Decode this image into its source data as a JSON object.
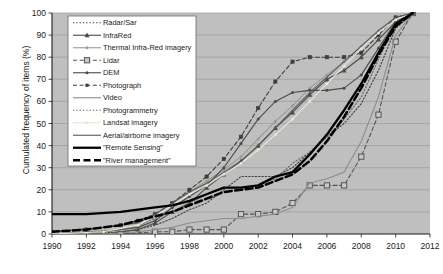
{
  "chart_data": {
    "type": "line",
    "title": "",
    "xlabel": "",
    "ylabel": "Cumulated frequency of items (%)",
    "xlim": [
      1990,
      2012
    ],
    "ylim": [
      0,
      100
    ],
    "xticks": [
      1990,
      1992,
      1994,
      1996,
      1998,
      2000,
      2002,
      2004,
      2006,
      2008,
      2010,
      2012
    ],
    "yticks": [
      0,
      10,
      20,
      30,
      40,
      50,
      60,
      70,
      80,
      90,
      100
    ],
    "grid": "horizontal",
    "legend_position": "upper-left-inside",
    "plot_background": "#bfbfbf",
    "series": [
      {
        "name": "Radar/Sar",
        "color": "#3a3a3a",
        "style": "dotted",
        "marker": "none",
        "x": [
          1990,
          1992,
          1994,
          1995,
          1996,
          1997,
          1998,
          1999,
          2000,
          2001,
          2002,
          2003,
          2004,
          2005,
          2006,
          2007,
          2008,
          2009,
          2010,
          2011
        ],
        "values": [
          0,
          0,
          1,
          2,
          4,
          7,
          11,
          14,
          20,
          26,
          26,
          26,
          30,
          37,
          44,
          50,
          59,
          74,
          93,
          100
        ]
      },
      {
        "name": "InfraRed",
        "color": "#4a4a4a",
        "style": "solid",
        "marker": "triangle",
        "x": [
          1990,
          1993,
          1995,
          1996,
          1997,
          1998,
          1999,
          2000,
          2001,
          2002,
          2003,
          2004,
          2005,
          2006,
          2007,
          2008,
          2009,
          2010,
          2011
        ],
        "values": [
          0,
          0,
          2,
          5,
          10,
          14,
          21,
          27,
          33,
          40,
          48,
          55,
          63,
          70,
          74,
          80,
          88,
          96,
          100
        ]
      },
      {
        "name": "Thermal Infra-Red imagery",
        "color": "#9a9a9a",
        "style": "solid",
        "marker": "dot",
        "x": [
          1990,
          1993,
          1995,
          1996,
          1997,
          1998,
          1999,
          2000,
          2001,
          2002,
          2003,
          2004,
          2005,
          2006,
          2007,
          2008,
          2009,
          2010,
          2011
        ],
        "values": [
          0,
          1,
          3,
          8,
          14,
          19,
          24,
          29,
          35,
          43,
          51,
          58,
          66,
          72,
          78,
          85,
          92,
          98,
          100
        ]
      },
      {
        "name": "Lidar",
        "color": "#555555",
        "style": "dashed",
        "marker": "square",
        "x": [
          1990,
          1992,
          1994,
          1996,
          1997,
          1998,
          1999,
          2000,
          2001,
          2002,
          2003,
          2004,
          2005,
          2006,
          2007,
          2008,
          2009,
          2010,
          2011
        ],
        "values": [
          0,
          0,
          0,
          1,
          1,
          2,
          2,
          2,
          9,
          9,
          10,
          14,
          22,
          22,
          22,
          35,
          54,
          87,
          100
        ]
      },
      {
        "name": "DEM",
        "color": "#4a4a4a",
        "style": "solid",
        "marker": "dot",
        "x": [
          1990,
          1993,
          1995,
          1996,
          1997,
          1998,
          1999,
          2000,
          2001,
          2002,
          2003,
          2004,
          2005,
          2006,
          2007,
          2008,
          2009,
          2010,
          2011
        ],
        "values": [
          0,
          1,
          3,
          6,
          12,
          17,
          22,
          30,
          41,
          52,
          60,
          64,
          65,
          65,
          66,
          72,
          84,
          96,
          100
        ]
      },
      {
        "name": "Photograph",
        "color": "#3d3d3d",
        "style": "dashed",
        "marker": "square-small",
        "x": [
          1990,
          1992,
          1994,
          1995,
          1996,
          1997,
          1998,
          1999,
          2000,
          2001,
          2002,
          2003,
          2004,
          2005,
          2006,
          2007,
          2008,
          2009,
          2010,
          2011
        ],
        "values": [
          1,
          2,
          4,
          6,
          9,
          14,
          20,
          26,
          34,
          44,
          57,
          69,
          78,
          80,
          80,
          80,
          82,
          90,
          98,
          100
        ]
      },
      {
        "name": "Video",
        "color": "#8e8e8e",
        "style": "solid",
        "marker": "none",
        "x": [
          1990,
          1993,
          1995,
          1996,
          1997,
          1998,
          1999,
          2000,
          2001,
          2002,
          2003,
          2004,
          2005,
          2006,
          2007,
          2008,
          2009,
          2010,
          2011
        ],
        "values": [
          0,
          0,
          1,
          2,
          3,
          5,
          6,
          7,
          7,
          8,
          9,
          12,
          23,
          25,
          28,
          42,
          62,
          90,
          100
        ]
      },
      {
        "name": "Photogrammetry",
        "color": "#666666",
        "style": "dotted",
        "marker": "none",
        "x": [
          1990,
          1992,
          1994,
          1995,
          1996,
          1997,
          1998,
          1999,
          2000,
          2001,
          2002,
          2003,
          2004,
          2005,
          2006,
          2007,
          2008,
          2009,
          2010,
          2011
        ],
        "values": [
          0,
          1,
          2,
          4,
          7,
          10,
          14,
          18,
          21,
          21,
          22,
          25,
          32,
          37,
          44,
          52,
          62,
          79,
          95,
          100
        ]
      },
      {
        "name": "Landsat imagery",
        "color": "#e8e8d0",
        "style": "solid",
        "marker": "dot",
        "x": [
          1990,
          1993,
          1995,
          1996,
          1997,
          1998,
          1999,
          2000,
          2001,
          2002,
          2003,
          2004,
          2005,
          2006,
          2007,
          2008,
          2009,
          2010,
          2011
        ],
        "values": [
          0,
          1,
          4,
          8,
          13,
          18,
          22,
          27,
          32,
          38,
          45,
          52,
          60,
          68,
          76,
          84,
          91,
          97,
          100
        ]
      },
      {
        "name": "Aerial/airborne imagery",
        "color": "#5a5a5a",
        "style": "solid",
        "marker": "none",
        "x": [
          1990,
          1993,
          1995,
          1996,
          1997,
          1998,
          1999,
          2000,
          2001,
          2002,
          2003,
          2004,
          2005,
          2006,
          2007,
          2008,
          2009,
          2010,
          2011
        ],
        "values": [
          1,
          3,
          5,
          9,
          14,
          19,
          23,
          28,
          33,
          40,
          48,
          56,
          64,
          71,
          78,
          85,
          92,
          98,
          100
        ]
      },
      {
        "name": "\"Remote Sensing\"",
        "color": "#000000",
        "style": "solid-thick",
        "marker": "none",
        "x": [
          1990,
          1992,
          1994,
          1995,
          1996,
          1997,
          1998,
          1999,
          2000,
          2001,
          2002,
          2003,
          2004,
          2005,
          2006,
          2007,
          2008,
          2009,
          2010,
          2011
        ],
        "values": [
          9,
          9,
          10,
          11,
          12,
          13,
          15,
          18,
          21,
          21,
          22,
          26,
          28,
          36,
          45,
          56,
          68,
          82,
          95,
          100
        ]
      },
      {
        "name": "\"River management\"",
        "color": "#000000",
        "style": "dashed-thick",
        "marker": "none",
        "x": [
          1990,
          1992,
          1994,
          1995,
          1996,
          1997,
          1998,
          1999,
          2000,
          2001,
          2002,
          2003,
          2004,
          2005,
          2006,
          2007,
          2008,
          2009,
          2010,
          2011
        ],
        "values": [
          1,
          2,
          4,
          6,
          8,
          10,
          13,
          16,
          19,
          20,
          21,
          24,
          27,
          33,
          42,
          53,
          66,
          81,
          94,
          100
        ]
      }
    ]
  },
  "legend": {
    "items": [
      {
        "label": "Radar/Sar"
      },
      {
        "label": "InfraRed"
      },
      {
        "label": "Thermal Infra-Red imagery"
      },
      {
        "label": "Lidar"
      },
      {
        "label": "DEM"
      },
      {
        "label": "Photograph"
      },
      {
        "label": "Video"
      },
      {
        "label": "Photogrammetry"
      },
      {
        "label": "Landsat imagery"
      },
      {
        "label": "Aerial/airborne imagery"
      },
      {
        "label": "\"Remote Sensing\""
      },
      {
        "label": "\"River management\""
      }
    ]
  }
}
